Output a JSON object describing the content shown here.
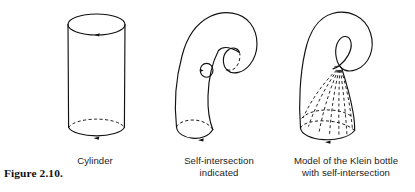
{
  "figure": {
    "number_label": "Figure 2.10.",
    "background_color": "#ffffff",
    "ink_color": "#111111"
  },
  "panels": [
    {
      "id": "cylinder",
      "caption": "Cylinder",
      "description": "Vertical cylinder with solid top ellipse and bottom ellipse whose far arc is dashed; oriented arrow marks on both boundary circles.",
      "elements": [
        "top-ellipse-solid",
        "bottom-ellipse-front-solid",
        "bottom-ellipse-back-dashed",
        "left-side-line",
        "right-side-line",
        "top-orientation-arrow",
        "bottom-orientation-arrow"
      ]
    },
    {
      "id": "self-intersection",
      "caption": "Self-intersection\nindicated",
      "description": "Cylinder bent over so its upper end curls down and pierces the wall; small circle on the tube wall marks the puncture, and the inner end opening is drawn with a dashed far arc.",
      "elements": [
        "bent-tube-outline",
        "bottom-ellipse-front-solid",
        "bottom-ellipse-back-dashed",
        "bottom-orientation-arrow",
        "puncture-circle",
        "puncture-circle-arrow",
        "inner-end-ellipse",
        "inner-end-dashed-arc"
      ]
    },
    {
      "id": "klein-bottle",
      "caption": "Model of the Klein bottle\nwith self-intersection",
      "description": "Klein bottle immersion: the narrow neck loops over, crosses itself and enters the body; dashed fan lines show the hidden tube descending to the bottom boundary circle.",
      "elements": [
        "body-outline",
        "neck-loop-crossing",
        "dashed-fan-lines",
        "bottom-ellipse-front-solid",
        "bottom-ellipse-back-dashed",
        "bottom-orientation-arrow"
      ],
      "dashed_fan_line_count": 7
    }
  ],
  "captions": {
    "cylinder": "Cylinder",
    "self_intersection": "Self-intersection\nindicated",
    "klein_bottle": "Model of the Klein bottle\nwith self-intersection"
  }
}
